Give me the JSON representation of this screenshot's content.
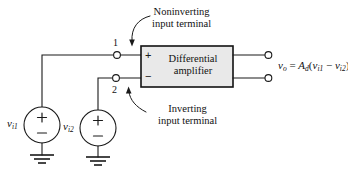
{
  "figure": {
    "background": "#ffffff",
    "line_color": "#1a1a1a",
    "block_fill": "#e9e9e9",
    "block_stroke": "#111111"
  },
  "block": {
    "label_line1": "Differential",
    "label_line2": "amplifier",
    "plus_sign": "+",
    "minus_sign": "−"
  },
  "annotations": {
    "noninverting": {
      "line1": "Noninverting",
      "line2": "input terminal",
      "points_to": "node-1"
    },
    "inverting": {
      "line1": "Inverting",
      "line2": "input terminal",
      "points_to": "node-2"
    }
  },
  "nodes": {
    "terminal_1_label": "1",
    "terminal_2_label": "2"
  },
  "sources": {
    "v_i1": {
      "symbol": "v",
      "subscript": "i1",
      "plus": "+",
      "minus": "−"
    },
    "v_i2": {
      "symbol": "v",
      "subscript": "i2",
      "plus": "+",
      "minus": "−"
    }
  },
  "output": {
    "symbol": "v",
    "subscript": "o",
    "equals": "=",
    "gain_symbol": "A",
    "gain_subscript": "d",
    "open_paren": "(",
    "term1_symbol": "v",
    "term1_subscript": "i1",
    "operator": "−",
    "term2_symbol": "v",
    "term2_subscript": "i2",
    "close_paren": ")",
    "full_text": "vₒ = Ad(vᵢ₁ − vᵢ₂)"
  },
  "ground": {
    "label": "ground",
    "count": 2
  }
}
